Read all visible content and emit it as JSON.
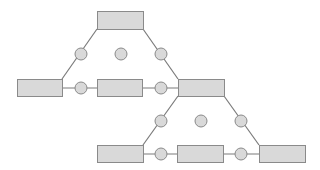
{
  "colors": {
    "background": "#ffffff",
    "node_fill": "#d9d9d9",
    "node_stroke": "#8a8a8a",
    "edge": "#7a7a7a"
  },
  "diagram": {
    "boxes": [
      {
        "id": "top",
        "x": 97,
        "y": 11,
        "w": 46,
        "h": 18
      },
      {
        "id": "mid-left",
        "x": 17,
        "y": 79,
        "w": 45,
        "h": 17
      },
      {
        "id": "mid-center",
        "x": 97,
        "y": 79,
        "w": 45,
        "h": 17
      },
      {
        "id": "mid-right",
        "x": 178,
        "y": 79,
        "w": 46,
        "h": 17
      },
      {
        "id": "bottom-left",
        "x": 97,
        "y": 145,
        "w": 46,
        "h": 17
      },
      {
        "id": "bottom-center",
        "x": 177,
        "y": 145,
        "w": 46,
        "h": 17
      },
      {
        "id": "bottom-right",
        "x": 259,
        "y": 145,
        "w": 46,
        "h": 17
      }
    ],
    "circles": [
      {
        "id": "c-top-left",
        "cx": 81,
        "cy": 54,
        "r": 6
      },
      {
        "id": "c-top-mid",
        "cx": 121,
        "cy": 54,
        "r": 6
      },
      {
        "id": "c-top-right",
        "cx": 161,
        "cy": 54,
        "r": 6
      },
      {
        "id": "c-mid-left",
        "cx": 81,
        "cy": 88,
        "r": 6
      },
      {
        "id": "c-mid-right",
        "cx": 161,
        "cy": 88,
        "r": 6
      },
      {
        "id": "c-low-left",
        "cx": 161,
        "cy": 121,
        "r": 6
      },
      {
        "id": "c-low-mid",
        "cx": 201,
        "cy": 121,
        "r": 6
      },
      {
        "id": "c-low-right",
        "cx": 241,
        "cy": 121,
        "r": 6
      },
      {
        "id": "c-bot-left",
        "cx": 161,
        "cy": 154,
        "r": 6
      },
      {
        "id": "c-bot-right",
        "cx": 241,
        "cy": 154,
        "r": 6
      }
    ],
    "edges": [
      {
        "x1": 97,
        "y1": 29,
        "x2": 62,
        "y2": 79
      },
      {
        "x1": 143,
        "y1": 29,
        "x2": 178,
        "y2": 79
      },
      {
        "x1": 62,
        "y1": 88,
        "x2": 97,
        "y2": 88
      },
      {
        "x1": 142,
        "y1": 88,
        "x2": 178,
        "y2": 88
      },
      {
        "x1": 178,
        "y1": 96,
        "x2": 143,
        "y2": 145
      },
      {
        "x1": 224,
        "y1": 96,
        "x2": 259,
        "y2": 145
      },
      {
        "x1": 143,
        "y1": 154,
        "x2": 177,
        "y2": 154
      },
      {
        "x1": 223,
        "y1": 154,
        "x2": 259,
        "y2": 154
      }
    ]
  }
}
